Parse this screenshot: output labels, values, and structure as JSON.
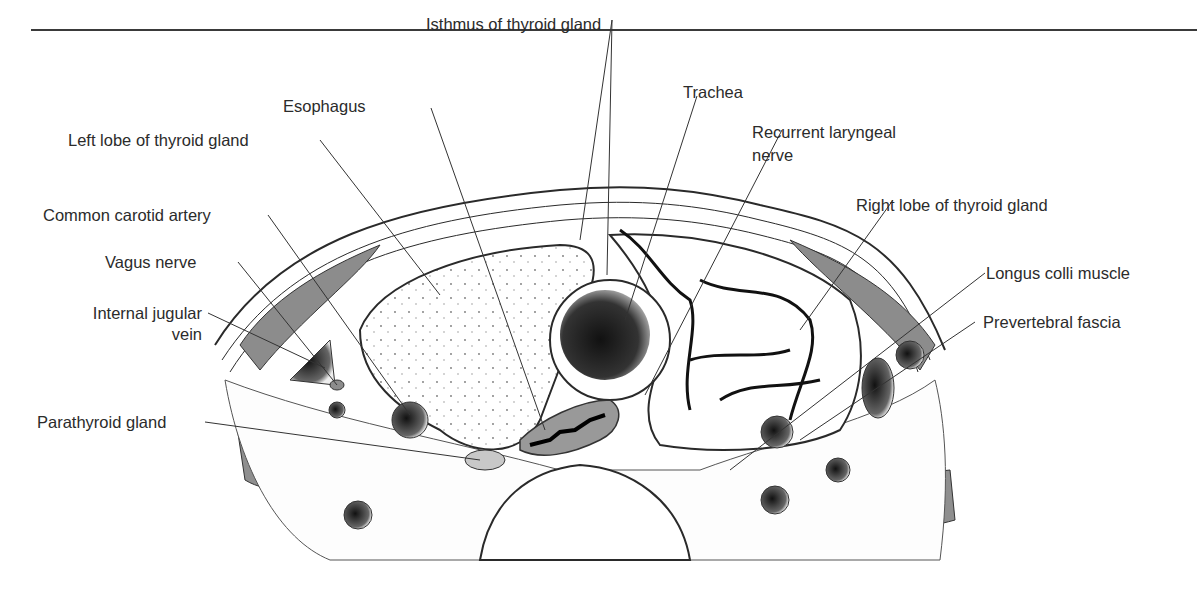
{
  "figure": {
    "labels": {
      "isthmus": "Isthmus of thyroid gland",
      "esophagus": "Esophagus",
      "trachea": "Trachea",
      "left_lobe": "Left lobe of thyroid gland",
      "recurrent_laryngeal_1": "Recurrent laryngeal",
      "recurrent_laryngeal_2": "nerve",
      "common_carotid": "Common carotid artery",
      "right_lobe": "Right lobe of thyroid gland",
      "vagus": "Vagus nerve",
      "longus_colli": "Longus colli muscle",
      "internal_jugular_1": "Internal jugular",
      "internal_jugular_2": "vein",
      "prevertebral": "Prevertebral fascia",
      "parathyroid": "Parathyroid gland"
    },
    "colors": {
      "line": "#2a2a2a",
      "muscle_gray": "#8c8c8c",
      "light_gray": "#c8c8c8",
      "dark_lumen": "#1a1a1a"
    }
  }
}
